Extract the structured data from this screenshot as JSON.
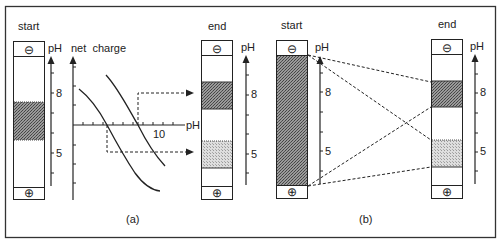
{
  "figure": {
    "panel_a": {
      "caption": "(a)",
      "start_label": "start",
      "end_label": "end",
      "start_tube": {
        "top_electrode": "⊖",
        "bottom_electrode": "⊕",
        "axis_label": "pH",
        "tick_labels": [
          "8",
          "5"
        ]
      },
      "graph": {
        "y_label": "net  charge",
        "x_label": "pH",
        "x_tick_label": "10"
      },
      "end_tube": {
        "top_electrode": "⊖",
        "bottom_electrode": "⊕",
        "axis_label": "pH",
        "tick_labels": [
          "8",
          "5"
        ]
      }
    },
    "panel_b": {
      "caption": "(b)",
      "start_label": "start",
      "end_label": "end",
      "start_tube": {
        "top_electrode": "⊖",
        "bottom_electrode": "⊕",
        "axis_label": "pH",
        "tick_labels": [
          "8",
          "5"
        ]
      },
      "end_tube": {
        "top_electrode": "⊖",
        "bottom_electrode": "⊕",
        "axis_label": "pH",
        "tick_labels": [
          "8",
          "5"
        ]
      }
    },
    "colors": {
      "line": "#222222",
      "band_dark": "#7a7a7a",
      "band_light": "#c9c9c9",
      "frame": "#333333"
    }
  }
}
